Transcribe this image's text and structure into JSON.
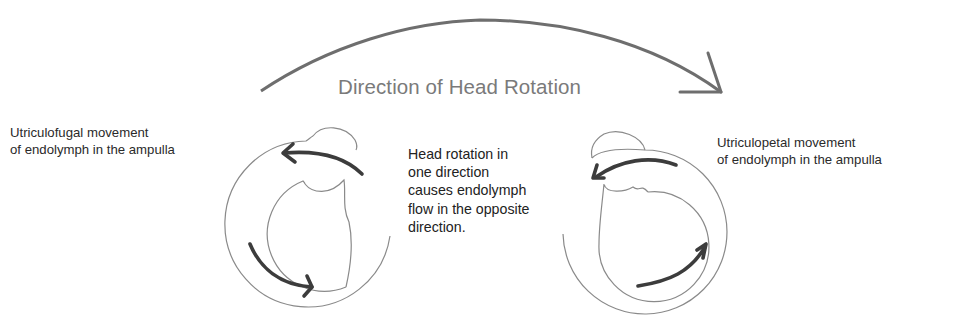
{
  "diagram": {
    "title": "Direction of Head Rotation",
    "left_ampulla": {
      "label_lines": [
        "Utriculofugal movement",
        "of endolymph in the ampulla"
      ],
      "flow": "utriculofugal"
    },
    "right_ampulla": {
      "label_lines": [
        "Utriculopetal movement",
        "of endolymph in the ampulla"
      ],
      "flow": "utriculopetal"
    },
    "explanation_lines": [
      "Head rotation in",
      "one direction",
      "causes endolymph",
      "flow in the opposite",
      "direction."
    ],
    "colors": {
      "outline": "#8a8a8a",
      "arrow": "#3c3c3c",
      "rotation_arrow": "#6e6e6e",
      "title": "#7a7a7a",
      "text": "#2a2a2a"
    },
    "icons": {
      "rotation_arrow": "curved-arrow-right-icon",
      "flow_arrow": "curved-arrow-icon"
    }
  }
}
